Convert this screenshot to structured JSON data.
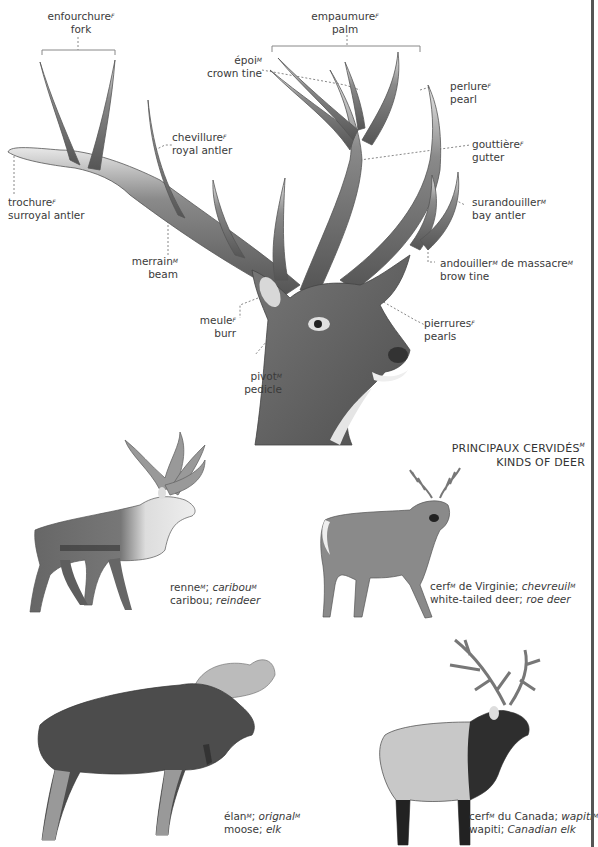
{
  "diagram": {
    "type": "labeled illustration",
    "colors": {
      "background": "#ffffff",
      "illustration": "#5a5a5a",
      "leader_lines": "#888888",
      "text": "#3a3a3a"
    }
  },
  "antler_labels": {
    "fork": {
      "fr": "enfourchure",
      "gender": "F",
      "en": "fork"
    },
    "palm": {
      "fr": "empaumure",
      "gender": "F",
      "en": "palm"
    },
    "crown": {
      "fr": "époi",
      "gender": "M",
      "en": "crown tine"
    },
    "pearl": {
      "fr": "perlure",
      "gender": "F",
      "en": "pearl"
    },
    "royal": {
      "fr": "chevillure",
      "gender": "F",
      "en": "royal antler"
    },
    "gutter": {
      "fr": "gouttière",
      "gender": "F",
      "en": "gutter"
    },
    "surroyal": {
      "fr": "trochure",
      "gender": "F",
      "en": "surroyal antler"
    },
    "bay": {
      "fr": "surandouiller",
      "gender": "M",
      "en": "bay antler"
    },
    "beam": {
      "fr": "merrain",
      "gender": "M",
      "en": "beam"
    },
    "brow": {
      "fr1": "andouiller",
      "gender1": "M",
      "mid": " de massacre",
      "gender2": "M",
      "en": "brow tine"
    },
    "burr": {
      "fr": "meule",
      "gender": "F",
      "en": "burr"
    },
    "pearls": {
      "fr": "pierrures",
      "gender": "F",
      "en": "pearls"
    },
    "pedicle": {
      "fr": "pivot",
      "gender": "M",
      "en": "pedicle"
    }
  },
  "section_title": {
    "fr": "PRINCIPAUX CERVIDÉS",
    "gender": "M",
    "en": "KINDS OF DEER"
  },
  "deer": [
    {
      "id": "caribou",
      "fr": "renne",
      "g1": "M",
      "sep": "; ",
      "fr_alt": "caribou",
      "g2": "M",
      "en": "caribou",
      "en_alt": "reindeer"
    },
    {
      "id": "white-tailed",
      "fr": "cerf",
      "g1": "M",
      "fr_rest": " de Virginie",
      "sep": "; ",
      "fr_alt": "chevreuil",
      "g2": "M",
      "en": "white-tailed deer",
      "en_alt": "roe deer"
    },
    {
      "id": "moose",
      "fr": "élan",
      "g1": "M",
      "sep": "; ",
      "fr_alt": "orignal",
      "g2": "M",
      "en": "moose",
      "en_alt": "elk"
    },
    {
      "id": "wapiti",
      "fr": "cerf",
      "g1": "M",
      "fr_rest": " du Canada",
      "sep": "; ",
      "fr_alt": "wapiti",
      "g2": "M",
      "en": "wapiti",
      "en_alt": "Canadian elk"
    }
  ],
  "punct": {
    "semicolon": "; "
  }
}
